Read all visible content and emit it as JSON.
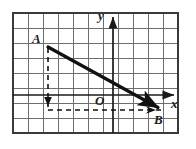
{
  "figure": {
    "background_color": "#ffffff",
    "grid": {
      "columns": 11,
      "rows": 8,
      "cell_size": 15,
      "origin_px": [
        13,
        13
      ],
      "grid_line_color": "#6b6b6b",
      "border_color": "#3a3a3a"
    },
    "axes": {
      "x_label": "x",
      "y_label": "y",
      "origin_label": "O",
      "axis_color": "#1a1a1a",
      "x_axis_y_px": 95,
      "y_axis_x_px": 113,
      "x_arrow_tip_px": [
        178,
        95
      ],
      "y_arrow_tip_px": [
        113,
        13
      ]
    },
    "points": [
      {
        "name": "A",
        "label": "A",
        "x_px": 48,
        "y_px": 47
      },
      {
        "name": "B",
        "label": "B",
        "x_px": 163,
        "y_px": 110
      }
    ],
    "vector": {
      "name": "vector-AB",
      "from": "A",
      "to": "B",
      "color": "#111111",
      "stroke_width": 3.2,
      "arrow": "filled-triangle"
    },
    "dashed_guides": [
      {
        "name": "vertical-drop-from-A",
        "orientation": "vertical",
        "from_px": [
          48,
          47
        ],
        "to_px": [
          48,
          110
        ],
        "arrow_at_px": [
          48,
          102
        ],
        "color": "#111111"
      },
      {
        "name": "horizontal-to-B",
        "orientation": "horizontal",
        "from_px": [
          48,
          110
        ],
        "to_px": [
          163,
          110
        ],
        "arrow_at_px": [
          151,
          110
        ],
        "color": "#111111"
      }
    ]
  }
}
